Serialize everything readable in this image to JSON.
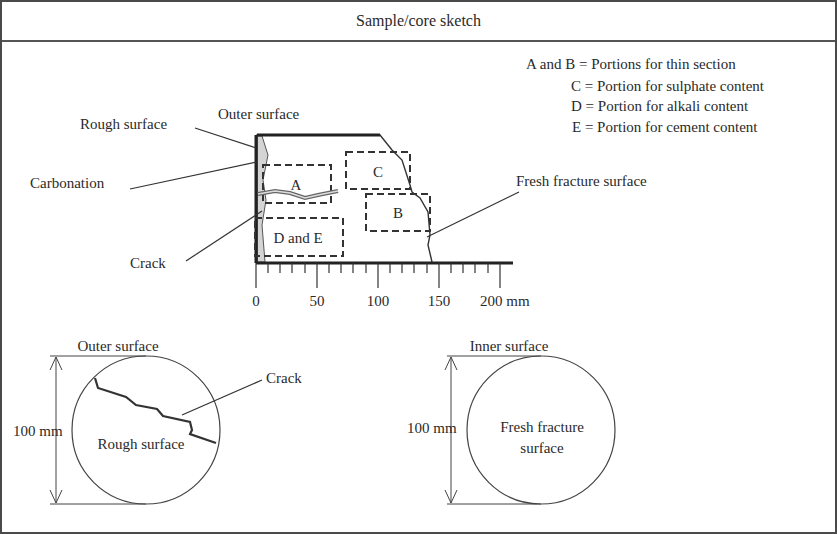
{
  "title": "Sample/core sketch",
  "legend": {
    "line1": "A and B = Portions for thin section",
    "line2": "C = Portion for sulphate content",
    "line3": "D = Portion for alkali content",
    "line4": "E = Portion for cement content"
  },
  "side_view": {
    "labels": {
      "outer_surface": "Outer surface",
      "rough_surface": "Rough surface",
      "carbonation": "Carbonation",
      "crack": "Crack",
      "fresh_fracture": "Fresh fracture surface"
    },
    "portions": {
      "a": "A",
      "b": "B",
      "c": "C",
      "de": "D and E"
    },
    "scale": {
      "ticks": [
        "0",
        "50",
        "100",
        "150",
        "200 mm"
      ]
    }
  },
  "outer_view": {
    "title": "Outer surface",
    "dimension": "100 mm",
    "crack_label": "Crack",
    "center_label": "Rough surface"
  },
  "inner_view": {
    "title": "Inner surface",
    "dimension": "100 mm",
    "center_label_1": "Fresh fracture",
    "center_label_2": "surface"
  }
}
